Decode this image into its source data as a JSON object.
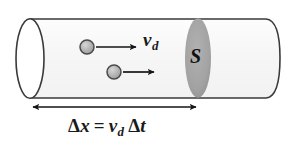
{
  "figure": {
    "caption_type": "physics-diagram",
    "width": 295,
    "height": 146,
    "background_color": "#ffffff"
  },
  "colors": {
    "outline": "#3a3a3a",
    "cylinder_body": "#f7f7f7",
    "cap_fill": "#ffffff",
    "cross_section_fill": "#a3a3a3",
    "electron_fill": "#b3b3b3",
    "electron_outline": "#4a4a4a",
    "arrow": "#151515",
    "text": "#1a1a1a"
  },
  "labels": {
    "drift_velocity": {
      "base": "v",
      "subscript": "d",
      "full": "v_d"
    },
    "cross_section": {
      "text": "S"
    },
    "equation": {
      "delta": "Δ",
      "x": "x",
      "equals": "=",
      "v": "v",
      "v_sub": "d",
      "t": "t",
      "full": "Δx = v_d Δt"
    }
  },
  "shapes": {
    "cylinder": {
      "name": "conductor-cylinder",
      "left_cap_center_x": 30,
      "right_edge_x": 280,
      "top_y": 19,
      "bottom_y": 98,
      "cap_rx": 14,
      "cap_ry": 40
    },
    "cross_section_ellipse": {
      "name": "cross-section-S",
      "center_x": 198,
      "center_y": 58,
      "rx": 13,
      "ry": 40
    },
    "electrons": [
      {
        "name": "electron-upper",
        "cx": 87,
        "cy": 47,
        "r": 7
      },
      {
        "name": "electron-lower",
        "cx": 114,
        "cy": 72,
        "r": 7
      }
    ],
    "velocity_arrows": [
      {
        "name": "velocity-arrow-upper",
        "x1": 96,
        "y1": 47,
        "x2": 138,
        "y2": 47
      },
      {
        "name": "velocity-arrow-lower",
        "x1": 123,
        "y1": 72,
        "x2": 156,
        "y2": 72
      }
    ],
    "distance_arrow": {
      "name": "displacement-arrow",
      "x1": 31,
      "x2": 198,
      "y": 107,
      "double_headed": true
    }
  }
}
